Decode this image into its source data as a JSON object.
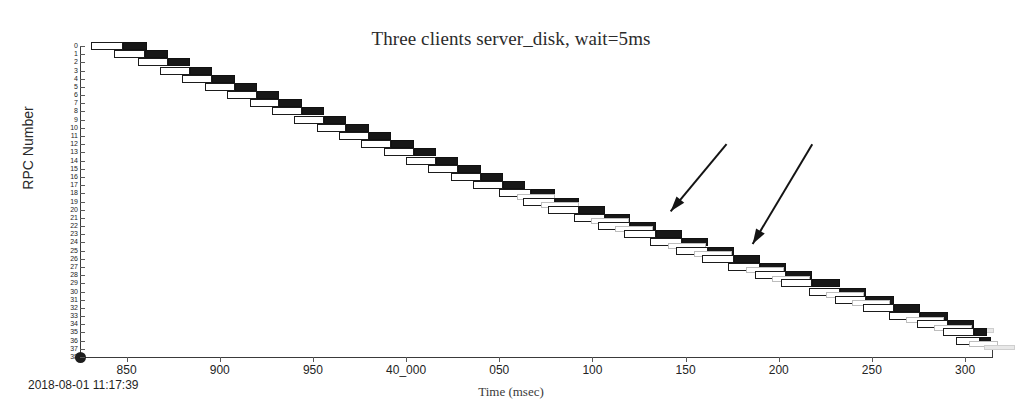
{
  "chart_data": {
    "type": "bar",
    "title": "Three clients server_disk, wait=5ms",
    "xlabel": "Time (msec)",
    "ylabel": "RPC Number",
    "grid": false,
    "legend": "none",
    "xlim": [
      39825,
      40315
    ],
    "ylim": [
      0,
      38
    ],
    "x_tick_labels": [
      "850",
      "900",
      "950",
      "40_000",
      "050",
      "100",
      "150",
      "200",
      "250",
      "300"
    ],
    "x_tick_values": [
      39850,
      39900,
      39950,
      40000,
      40050,
      40100,
      40150,
      40200,
      40250,
      40300
    ],
    "y_tick_labels": [
      "0",
      "1",
      "2",
      "3",
      "4",
      "5",
      "6",
      "7",
      "8",
      "9",
      "10",
      "11",
      "12",
      "13",
      "14",
      "15",
      "16",
      "17",
      "18",
      "19",
      "20",
      "21",
      "22",
      "23",
      "24",
      "25",
      "26",
      "27",
      "28",
      "29",
      "30",
      "31",
      "32",
      "33",
      "34",
      "35",
      "36",
      "37",
      "38"
    ],
    "y_tick_values": [
      0,
      1,
      2,
      3,
      4,
      5,
      6,
      7,
      8,
      9,
      10,
      11,
      12,
      13,
      14,
      15,
      16,
      17,
      18,
      19,
      20,
      21,
      22,
      23,
      24,
      25,
      26,
      27,
      28,
      29,
      30,
      31,
      32,
      33,
      34,
      35,
      36,
      37,
      38
    ],
    "series": [
      {
        "name": "client-rpc-span",
        "style": "outlined",
        "color": "#ffffff",
        "edgecolor": "#1b1b1b"
      },
      {
        "name": "server-rpc-span",
        "style": "filled",
        "color": "#171717"
      },
      {
        "name": "secondary-rpc-span",
        "style": "faint",
        "color": "#e8e8e8",
        "edgecolor": "#c4c4c4"
      }
    ],
    "rows": [
      {
        "rpc": 0,
        "client_start": 39831,
        "client_end": 39848,
        "server_start": 39848,
        "server_end": 39861
      },
      {
        "rpc": 1,
        "client_start": 39843,
        "client_end": 39860,
        "server_start": 39860,
        "server_end": 39872
      },
      {
        "rpc": 2,
        "client_start": 39856,
        "client_end": 39872,
        "server_start": 39872,
        "server_end": 39884
      },
      {
        "rpc": 3,
        "client_start": 39868,
        "client_end": 39884,
        "server_start": 39884,
        "server_end": 39896
      },
      {
        "rpc": 4,
        "client_start": 39880,
        "client_end": 39896,
        "server_start": 39896,
        "server_end": 39908
      },
      {
        "rpc": 5,
        "client_start": 39892,
        "client_end": 39908,
        "server_start": 39908,
        "server_end": 39920
      },
      {
        "rpc": 6,
        "client_start": 39904,
        "client_end": 39920,
        "server_start": 39920,
        "server_end": 39932
      },
      {
        "rpc": 7,
        "client_start": 39916,
        "client_end": 39932,
        "server_start": 39932,
        "server_end": 39944
      },
      {
        "rpc": 8,
        "client_start": 39928,
        "client_end": 39944,
        "server_start": 39944,
        "server_end": 39956
      },
      {
        "rpc": 9,
        "client_start": 39940,
        "client_end": 39956,
        "server_start": 39956,
        "server_end": 39968
      },
      {
        "rpc": 10,
        "client_start": 39952,
        "client_end": 39968,
        "server_start": 39968,
        "server_end": 39980
      },
      {
        "rpc": 11,
        "client_start": 39964,
        "client_end": 39980,
        "server_start": 39980,
        "server_end": 39992
      },
      {
        "rpc": 12,
        "client_start": 39976,
        "client_end": 39992,
        "server_start": 39992,
        "server_end": 40004
      },
      {
        "rpc": 13,
        "client_start": 39988,
        "client_end": 40004,
        "server_start": 40004,
        "server_end": 40016
      },
      {
        "rpc": 14,
        "client_start": 40000,
        "client_end": 40016,
        "server_start": 40016,
        "server_end": 40028
      },
      {
        "rpc": 15,
        "client_start": 40012,
        "client_end": 40028,
        "server_start": 40028,
        "server_end": 40040
      },
      {
        "rpc": 16,
        "client_start": 40024,
        "client_end": 40040,
        "server_start": 40040,
        "server_end": 40052
      },
      {
        "rpc": 17,
        "client_start": 40036,
        "client_end": 40052,
        "server_start": 40052,
        "server_end": 40064
      },
      {
        "rpc": 18,
        "client_start": 40050,
        "client_end": 40067,
        "server_start": 40067,
        "server_end": 40080,
        "faint": true
      },
      {
        "rpc": 19,
        "client_start": 40063,
        "client_end": 40080,
        "server_start": 40080,
        "server_end": 40093,
        "faint": true
      },
      {
        "rpc": 20,
        "client_start": 40076,
        "client_end": 40093,
        "server_start": 40093,
        "server_end": 40107
      },
      {
        "rpc": 21,
        "client_start": 40090,
        "client_end": 40107,
        "server_start": 40107,
        "server_end": 40120,
        "faint": true
      },
      {
        "rpc": 22,
        "client_start": 40103,
        "client_end": 40120,
        "server_start": 40120,
        "server_end": 40134,
        "faint": true
      },
      {
        "rpc": 23,
        "client_start": 40117,
        "client_end": 40134,
        "server_start": 40134,
        "server_end": 40148
      },
      {
        "rpc": 24,
        "client_start": 40131,
        "client_end": 40148,
        "server_start": 40148,
        "server_end": 40162,
        "faint": true
      },
      {
        "rpc": 25,
        "client_start": 40145,
        "client_end": 40162,
        "server_start": 40162,
        "server_end": 40176,
        "faint": true
      },
      {
        "rpc": 26,
        "client_start": 40159,
        "client_end": 40176,
        "server_start": 40176,
        "server_end": 40190
      },
      {
        "rpc": 27,
        "client_start": 40173,
        "client_end": 40190,
        "server_start": 40190,
        "server_end": 40204,
        "faint": true
      },
      {
        "rpc": 28,
        "client_start": 40187,
        "client_end": 40204,
        "server_start": 40204,
        "server_end": 40218,
        "faint": true
      },
      {
        "rpc": 29,
        "client_start": 40201,
        "client_end": 40218,
        "server_start": 40218,
        "server_end": 40233
      },
      {
        "rpc": 30,
        "client_start": 40216,
        "client_end": 40233,
        "server_start": 40233,
        "server_end": 40247,
        "faint": true
      },
      {
        "rpc": 31,
        "client_start": 40230,
        "client_end": 40247,
        "server_start": 40247,
        "server_end": 40262,
        "faint": true
      },
      {
        "rpc": 32,
        "client_start": 40245,
        "client_end": 40262,
        "server_start": 40262,
        "server_end": 40276
      },
      {
        "rpc": 33,
        "client_start": 40259,
        "client_end": 40276,
        "server_start": 40276,
        "server_end": 40291,
        "faint": true
      },
      {
        "rpc": 34,
        "client_start": 40274,
        "client_end": 40291,
        "server_start": 40291,
        "server_end": 40305,
        "faint": true
      },
      {
        "rpc": 35,
        "client_start": 40288,
        "client_end": 40305,
        "server_start": 40305,
        "server_end": 40312
      },
      {
        "rpc": 36,
        "client_start": 40295,
        "client_end": 40308,
        "server_start": 40308,
        "server_end": 40314,
        "faint": true
      }
    ],
    "annotations": [
      {
        "name": "arrow-1",
        "target_x": 40142,
        "target_y": 20.2,
        "tail_x": 40172,
        "tail_y": 12.0
      },
      {
        "name": "arrow-2",
        "target_x": 40186,
        "target_y": 24.2,
        "tail_x": 40218,
        "tail_y": 12.0
      }
    ]
  },
  "footer": {
    "timestamp": "2018-08-01 11:17:39"
  }
}
